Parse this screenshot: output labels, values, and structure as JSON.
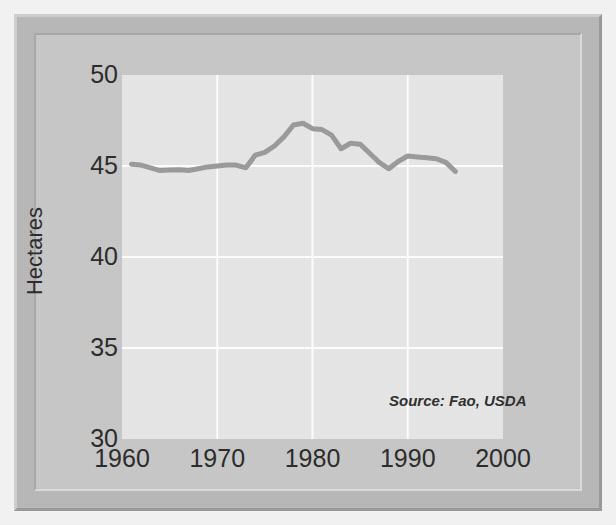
{
  "figure": {
    "source_note": "Source: Fao, USDA",
    "frame_color": "#b9b9b9",
    "panel_color": "#c8c8c8",
    "plot_background": "#e7e7e7",
    "page_background": "#f4f4f4"
  },
  "chart_data": {
    "type": "line",
    "title": "",
    "xlabel": "",
    "ylabel": "Hectares",
    "xlim": [
      1960,
      2000
    ],
    "ylim": [
      30,
      50
    ],
    "grid": true,
    "legend": null,
    "line_color": "#9b9b9b",
    "line_width": 5,
    "gridline_color": "#ffffff",
    "xticks": [
      1960,
      1970,
      1980,
      1990,
      2000
    ],
    "xtick_labels": [
      "1960",
      "1970",
      "1980",
      "1990",
      "2000"
    ],
    "yticks": [
      30,
      35,
      40,
      45,
      50
    ],
    "ytick_labels": [
      "30",
      "35",
      "40",
      "45",
      "50"
    ],
    "annotations": [
      {
        "text": "Source: Fao, USDA",
        "x": 1988,
        "y": 32.2,
        "style": "italic"
      }
    ],
    "series": [
      {
        "name": "Hectares",
        "x": [
          1961,
          1962,
          1963,
          1964,
          1965,
          1966,
          1967,
          1968,
          1969,
          1970,
          1971,
          1972,
          1973,
          1974,
          1975,
          1976,
          1977,
          1978,
          1979,
          1980,
          1981,
          1982,
          1983,
          1984,
          1985,
          1986,
          1987,
          1988,
          1989,
          1990,
          1991,
          1992,
          1993,
          1994,
          1995
        ],
        "values": [
          45.1,
          45.05,
          44.9,
          44.75,
          44.78,
          44.8,
          44.75,
          44.85,
          44.95,
          45.0,
          45.05,
          45.05,
          44.9,
          45.6,
          45.75,
          46.1,
          46.6,
          47.25,
          47.35,
          47.05,
          47.0,
          46.7,
          45.95,
          46.25,
          46.2,
          45.7,
          45.2,
          44.85,
          45.25,
          45.55,
          45.5,
          45.45,
          45.4,
          45.2,
          44.7
        ]
      }
    ]
  }
}
